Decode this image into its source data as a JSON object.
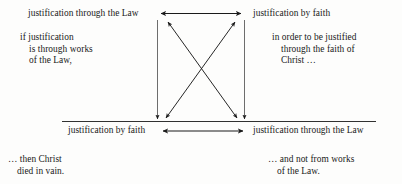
{
  "diagram": {
    "background_color": "#fdfdfc",
    "ink_color": "#1a1a1a",
    "nodes": {
      "top_left": "justification through the Law",
      "top_right": "justification by faith",
      "bottom_left": "justification by faith",
      "bottom_right": "justification through the Law"
    },
    "glosses": {
      "top_left": {
        "line1": "if justification",
        "line2": "is through works",
        "line3": "of the Law,"
      },
      "top_right": {
        "line1": "in order to be justified",
        "line2": "through the faith of",
        "line3": "Christ …"
      },
      "bottom_left": {
        "line1": "… then Christ",
        "line2": "died in vain."
      },
      "bottom_right": {
        "line1": "… and not from works",
        "line2": "of the Law."
      }
    },
    "connectors": [
      {
        "name": "top-horizontal-arrow",
        "style": "double-headed",
        "from": "top_left",
        "to": "top_right"
      },
      {
        "name": "bottom-horizontal-arrow",
        "style": "double-headed",
        "from": "bottom_left",
        "to": "bottom_right"
      },
      {
        "name": "left-vertical-arrow",
        "style": "single-headed-down",
        "from": "top_left",
        "to": "bottom_left"
      },
      {
        "name": "right-vertical-arrow",
        "style": "single-headed-down",
        "from": "top_right",
        "to": "bottom_right"
      },
      {
        "name": "diagonal-arrow-nw-se",
        "style": "double-headed",
        "from": "top_left",
        "to": "bottom_right"
      },
      {
        "name": "diagonal-arrow-ne-sw",
        "style": "double-headed",
        "from": "top_right",
        "to": "bottom_left"
      }
    ],
    "rules": [
      {
        "name": "bottom-row-rule",
        "x1": 62,
        "x2": 376,
        "y": 121
      }
    ]
  }
}
